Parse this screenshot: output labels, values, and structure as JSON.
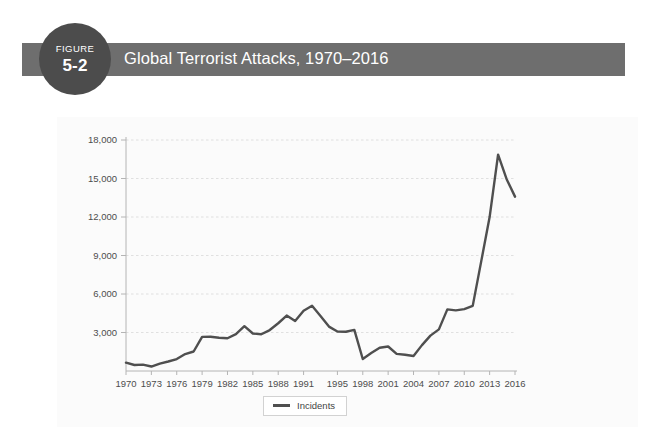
{
  "figure": {
    "badge_word": "FIGURE",
    "badge_number": "5-2",
    "title": "Global Terrorist Attacks, 1970–2016",
    "banner_color": "#6e6e6e",
    "badge_color": "#4c4c4c",
    "title_color": "#ffffff"
  },
  "legend": {
    "label": "Incidents",
    "swatch_color": "#4f4f4f",
    "position": "bottom-center"
  },
  "chart_data": {
    "type": "line",
    "title": "Global Terrorist Attacks, 1970–2016",
    "xlabel": "",
    "ylabel": "",
    "series": [
      {
        "name": "Incidents",
        "color": "#4f4f4f",
        "values": [
          650,
          470,
          500,
          350,
          580,
          740,
          930,
          1320,
          1520,
          2660,
          2670,
          2590,
          2550,
          2870,
          3490,
          2920,
          2860,
          3190,
          3720,
          4320,
          3890,
          4690,
          5080,
          4290,
          3460,
          3080,
          3060,
          3200,
          934,
          1396,
          1814,
          1908,
          1333,
          1264,
          1166,
          2017,
          2758,
          3243,
          4804,
          4722,
          4826,
          5076,
          8522,
          11996,
          16860,
          14965,
          13587
        ]
      }
    ],
    "x": [
      1970,
      1971,
      1972,
      1973,
      1974,
      1975,
      1976,
      1977,
      1978,
      1979,
      1980,
      1981,
      1982,
      1983,
      1984,
      1985,
      1986,
      1987,
      1988,
      1989,
      1990,
      1991,
      1992,
      1993,
      1994,
      1995,
      1996,
      1997,
      1998,
      1999,
      2000,
      2001,
      2002,
      2003,
      2004,
      2005,
      2006,
      2007,
      2008,
      2009,
      2010,
      2011,
      2012,
      2013,
      2014,
      2015,
      2016
    ],
    "xtick_labels": [
      "1970",
      "1973",
      "1976",
      "1979",
      "1982",
      "1985",
      "1988",
      "1991",
      "1995",
      "1998",
      "2001",
      "2004",
      "2007",
      "2010",
      "2013",
      "2016"
    ],
    "ytick_labels": [
      "3,000",
      "6,000",
      "9,000",
      "12,000",
      "15,000",
      "18,000"
    ],
    "ytick_values": [
      3000,
      6000,
      9000,
      12000,
      15000,
      18000
    ],
    "ylim": [
      0,
      18000
    ],
    "xlim": [
      1970,
      2016
    ],
    "grid": true,
    "grid_color": "#d9d9d9",
    "legend_position": "bottom-center"
  }
}
